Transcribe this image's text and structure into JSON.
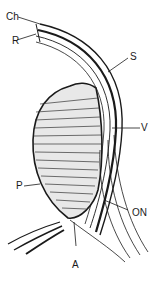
{
  "diagram": {
    "type": "anatomical-section",
    "labels": {
      "ch": "Ch",
      "r": "R",
      "s": "S",
      "v": "V",
      "p": "P",
      "on": "ON",
      "a": "A"
    },
    "colors": {
      "ink": "#1a1a1a",
      "background": "#ffffff"
    }
  }
}
